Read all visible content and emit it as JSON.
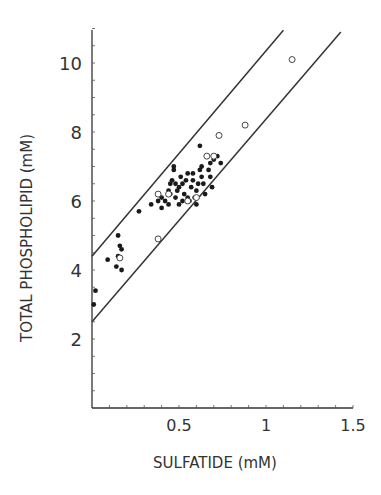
{
  "chart_data": {
    "type": "scatter",
    "title": "",
    "xlabel": "SULFATIDE (mM)",
    "ylabel": "TOTAL PHOSPHOLIPID (mM)",
    "xlim": [
      0,
      1.5
    ],
    "ylim": [
      0,
      11
    ],
    "xticks": [
      {
        "v": 0.5,
        "label": "0.5"
      },
      {
        "v": 1,
        "label": "1"
      },
      {
        "v": 1.5,
        "label": "1.5"
      }
    ],
    "yticks": [
      {
        "v": 2,
        "label": "2"
      },
      {
        "v": 4,
        "label": "4"
      },
      {
        "v": 6,
        "label": "6"
      },
      {
        "v": 8,
        "label": "8"
      },
      {
        "v": 10,
        "label": "10"
      }
    ],
    "grid": false,
    "legend": null,
    "series": [
      {
        "name": "filled",
        "marker": "filled-circle",
        "points": [
          [
            0.02,
            3.4
          ],
          [
            0.01,
            3.0
          ],
          [
            0.09,
            4.3
          ],
          [
            0.14,
            4.1
          ],
          [
            0.15,
            5.0
          ],
          [
            0.16,
            4.7
          ],
          [
            0.17,
            4.6
          ],
          [
            0.17,
            4.0
          ],
          [
            0.15,
            4.4
          ],
          [
            0.27,
            5.7
          ],
          [
            0.34,
            5.9
          ],
          [
            0.38,
            6.0
          ],
          [
            0.4,
            6.1
          ],
          [
            0.42,
            6.0
          ],
          [
            0.44,
            5.9
          ],
          [
            0.44,
            6.3
          ],
          [
            0.45,
            6.5
          ],
          [
            0.46,
            6.6
          ],
          [
            0.47,
            6.9
          ],
          [
            0.47,
            7.0
          ],
          [
            0.48,
            6.5
          ],
          [
            0.49,
            6.3
          ],
          [
            0.5,
            6.4
          ],
          [
            0.51,
            6.7
          ],
          [
            0.52,
            6.5
          ],
          [
            0.52,
            6.0
          ],
          [
            0.53,
            6.2
          ],
          [
            0.54,
            6.6
          ],
          [
            0.55,
            6.8
          ],
          [
            0.55,
            6.1
          ],
          [
            0.57,
            6.4
          ],
          [
            0.58,
            6.6
          ],
          [
            0.59,
            6.1
          ],
          [
            0.6,
            6.3
          ],
          [
            0.6,
            5.9
          ],
          [
            0.61,
            6.5
          ],
          [
            0.62,
            6.9
          ],
          [
            0.63,
            7.0
          ],
          [
            0.63,
            6.7
          ],
          [
            0.64,
            6.5
          ],
          [
            0.65,
            6.2
          ],
          [
            0.66,
            7.3
          ],
          [
            0.67,
            6.9
          ],
          [
            0.68,
            7.1
          ],
          [
            0.68,
            6.7
          ],
          [
            0.69,
            6.4
          ],
          [
            0.7,
            7.2
          ],
          [
            0.72,
            7.3
          ],
          [
            0.74,
            7.1
          ],
          [
            0.62,
            7.6
          ],
          [
            0.45,
            6.2
          ],
          [
            0.5,
            5.9
          ],
          [
            0.56,
            6.0
          ],
          [
            0.4,
            5.8
          ],
          [
            0.48,
            6.1
          ],
          [
            0.58,
            6.8
          ]
        ]
      },
      {
        "name": "open",
        "marker": "open-circle",
        "points": [
          [
            0.16,
            4.35
          ],
          [
            0.38,
            4.9
          ],
          [
            0.38,
            6.2
          ],
          [
            0.44,
            6.2
          ],
          [
            0.55,
            6.0
          ],
          [
            0.6,
            6.1
          ],
          [
            0.66,
            7.3
          ],
          [
            0.7,
            7.3
          ],
          [
            0.73,
            7.9
          ],
          [
            0.88,
            8.2
          ],
          [
            1.15,
            10.1
          ]
        ]
      }
    ],
    "lines": [
      {
        "name": "upper-bound",
        "x": [
          0,
          1.1
        ],
        "y": [
          4.4,
          10.95
        ]
      },
      {
        "name": "lower-bound",
        "x": [
          0,
          1.43
        ],
        "y": [
          2.5,
          10.9
        ]
      }
    ]
  }
}
